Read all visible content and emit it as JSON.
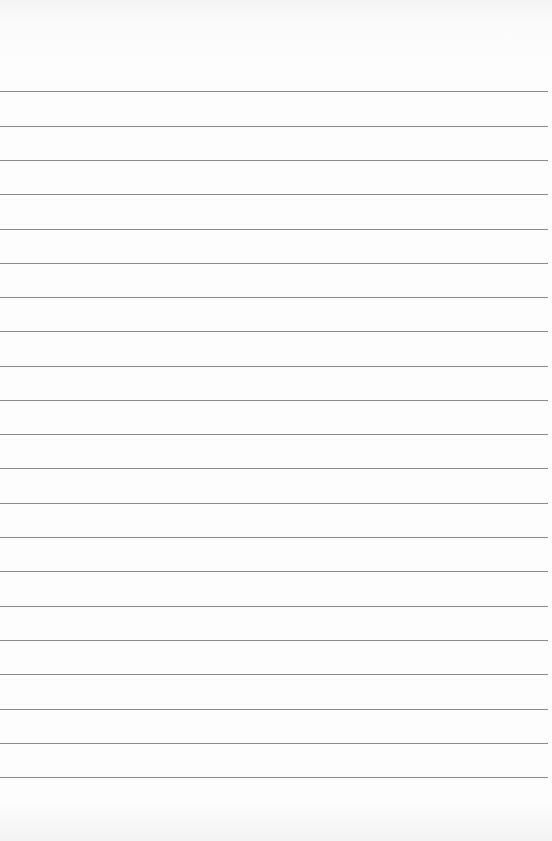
{
  "paper": {
    "type": "lined-paper",
    "background_color": "#fdfdfd",
    "rule_color": "#8a8a8a",
    "rule_count": 21,
    "rule_positions_y": [
      91,
      126,
      160,
      194,
      229,
      263,
      297,
      331,
      366,
      400,
      434,
      468,
      503,
      537,
      571,
      606,
      640,
      674,
      709,
      743,
      777
    ]
  }
}
